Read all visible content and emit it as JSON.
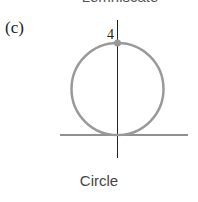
{
  "figure": {
    "top_caption_partial": "Lemniscate",
    "panel_label": "(c)",
    "caption": "Circle",
    "y_axis_label": "4",
    "colors": {
      "curve": "#999999",
      "axes": "#222222",
      "point": "#999999"
    }
  }
}
